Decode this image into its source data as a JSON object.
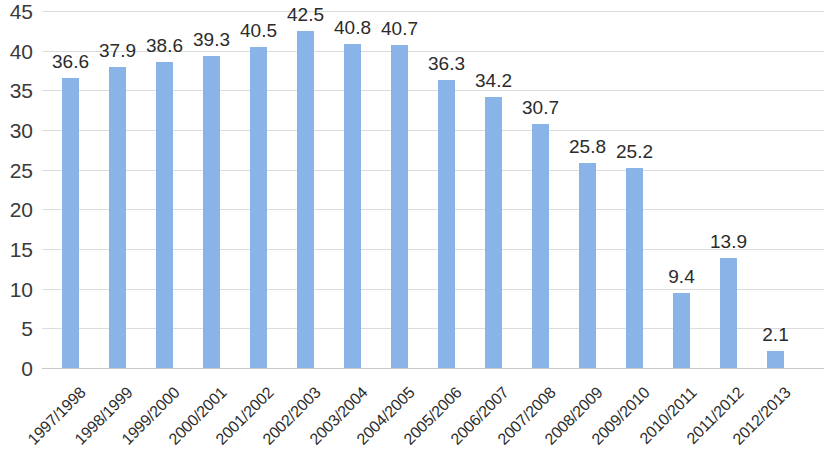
{
  "chart_data": {
    "type": "bar",
    "title": "",
    "subtitle": "",
    "xlabel": "",
    "ylabel": "",
    "ylim": [
      0,
      45
    ],
    "ytick_step": 5,
    "yticks": [
      "0",
      "5",
      "10",
      "15",
      "20",
      "25",
      "30",
      "35",
      "40",
      "45"
    ],
    "grid": true,
    "legend": false,
    "legend_position": "none",
    "bar_color": "#8ab3e8",
    "gridline_color": "#dcdcdc",
    "label_color": "#2b2b2b",
    "categories": [
      "1997/1998",
      "1998/1999",
      "1999/2000",
      "2000/2001",
      "2001/2002",
      "2002/2003",
      "2003/2004",
      "2004/2005",
      "2005/2006",
      "2006/2007",
      "2007/2008",
      "2008/2009",
      "2009/2010",
      "2010/2011",
      "2011/2012",
      "2012/2013"
    ],
    "values": [
      36.6,
      37.9,
      38.6,
      39.3,
      40.5,
      42.5,
      40.8,
      40.7,
      36.3,
      34.2,
      30.7,
      25.8,
      25.2,
      9.4,
      13.9,
      2.1
    ],
    "data_labels": [
      "36.6",
      "37.9",
      "38.6",
      "39.3",
      "40.5",
      "42.5",
      "40.8",
      "40.7",
      "36.3",
      "34.2",
      "30.7",
      "25.8",
      "25.2",
      "9.4",
      "13.9",
      "2.1"
    ]
  }
}
